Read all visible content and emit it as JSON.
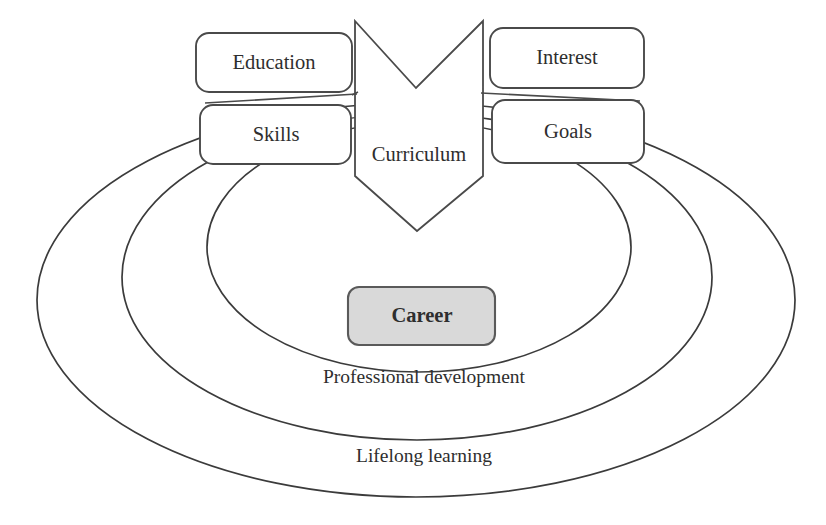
{
  "diagram": {
    "colors": {
      "background": "#ffffff",
      "stroke": "#4a4a4a",
      "ring_stroke": "#3b3b3b",
      "career_fill": "#d9d9d9",
      "box_fill": "#ffffff",
      "text": "#2e2e2e"
    },
    "center_shape": {
      "name": "curriculum-chevron",
      "label": "Curriculum",
      "shape": "down-chevron-pentagon"
    },
    "input_boxes": [
      {
        "id": "education",
        "label": "Education",
        "side": "left",
        "row": "top"
      },
      {
        "id": "skills",
        "label": "Skills",
        "side": "left",
        "row": "bottom"
      },
      {
        "id": "interest",
        "label": "Interest",
        "side": "right",
        "row": "top"
      },
      {
        "id": "goals",
        "label": "Goals",
        "side": "right",
        "row": "bottom"
      }
    ],
    "core_box": {
      "id": "career",
      "label": "Career",
      "fill": "#d9d9d9",
      "bold": true
    },
    "rings": [
      {
        "id": "inner",
        "label": "",
        "order": 1
      },
      {
        "id": "middle",
        "label": "Professional development",
        "order": 2
      },
      {
        "id": "outer",
        "label": "Lifelong learning",
        "order": 3
      }
    ],
    "ring_labels": {
      "middle": "Professional development",
      "outer": "Lifelong learning"
    }
  }
}
